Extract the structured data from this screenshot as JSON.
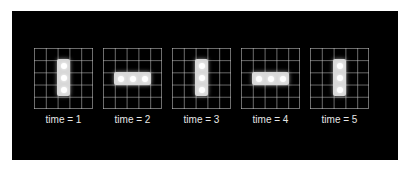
{
  "figure": {
    "title": "",
    "background": "#000000",
    "grid_size": [
      5,
      5
    ],
    "frames": [
      {
        "label": "time = 1",
        "orientation": "vertical",
        "cells": [
          [
            1,
            2
          ],
          [
            2,
            2
          ],
          [
            3,
            2
          ]
        ]
      },
      {
        "label": "time = 2",
        "orientation": "horizontal",
        "cells": [
          [
            2,
            1
          ],
          [
            2,
            2
          ],
          [
            2,
            3
          ]
        ]
      },
      {
        "label": "time = 3",
        "orientation": "vertical",
        "cells": [
          [
            1,
            2
          ],
          [
            2,
            2
          ],
          [
            3,
            2
          ]
        ]
      },
      {
        "label": "time = 4",
        "orientation": "horizontal",
        "cells": [
          [
            2,
            1
          ],
          [
            2,
            2
          ],
          [
            2,
            3
          ]
        ]
      },
      {
        "label": "time = 5",
        "orientation": "vertical",
        "cells": [
          [
            1,
            2
          ],
          [
            2,
            2
          ],
          [
            3,
            2
          ]
        ]
      }
    ]
  }
}
